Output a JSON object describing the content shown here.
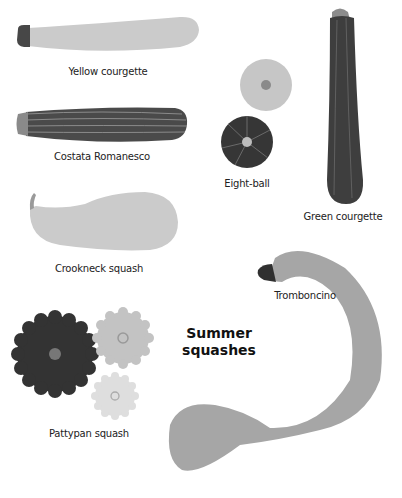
{
  "title": {
    "line1": "Summer",
    "line2": "squashes"
  },
  "colors": {
    "light": "#c8c8c8",
    "mid": "#a8a8a8",
    "dark": "#3a3a3a",
    "darker": "#2e2e2e"
  },
  "squashes": [
    {
      "label": "Yellow courgette"
    },
    {
      "label": "Costata Romanesco"
    },
    {
      "label": "Eight-ball"
    },
    {
      "label": "Green courgette"
    },
    {
      "label": "Crookneck squash"
    },
    {
      "label": "Tromboncino"
    },
    {
      "label": "Pattypan squash"
    }
  ]
}
